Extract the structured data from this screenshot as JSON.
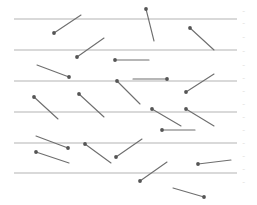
{
  "diagram": {
    "title": "",
    "type": "buffon-needle-simulation",
    "colors": {
      "background": "#ffffff",
      "line": "#b4b4b4",
      "needle": "#6e6e6e",
      "needle_head": "#555555",
      "label": "#c8c8c8"
    },
    "ruled_lines": [
      {
        "x1": 14,
        "x2": 237,
        "y": 19
      },
      {
        "x1": 14,
        "x2": 237,
        "y": 50
      },
      {
        "x1": 14,
        "x2": 237,
        "y": 81
      },
      {
        "x1": 14,
        "x2": 237,
        "y": 112
      },
      {
        "x1": 14,
        "x2": 237,
        "y": 143
      },
      {
        "x1": 14,
        "x2": 237,
        "y": 173
      }
    ],
    "needles": [
      {
        "hx": 54,
        "hy": 33,
        "tx": 81,
        "ty": 15
      },
      {
        "hx": 146,
        "hy": 9,
        "tx": 154,
        "ty": 41
      },
      {
        "hx": 77,
        "hy": 57,
        "tx": 104,
        "ty": 38
      },
      {
        "hx": 190,
        "hy": 28,
        "tx": 214,
        "ty": 50
      },
      {
        "hx": 115,
        "hy": 60,
        "tx": 149,
        "ty": 60
      },
      {
        "hx": 69,
        "hy": 77,
        "tx": 37,
        "ty": 65
      },
      {
        "hx": 167,
        "hy": 79,
        "tx": 133,
        "ty": 79
      },
      {
        "hx": 117,
        "hy": 81,
        "tx": 140,
        "ty": 104
      },
      {
        "hx": 186,
        "hy": 92,
        "tx": 214,
        "ty": 74
      },
      {
        "hx": 34,
        "hy": 97,
        "tx": 58,
        "ty": 119
      },
      {
        "hx": 79,
        "hy": 94,
        "tx": 104,
        "ty": 117
      },
      {
        "hx": 152,
        "hy": 109,
        "tx": 181,
        "ty": 126
      },
      {
        "hx": 186,
        "hy": 109,
        "tx": 214,
        "ty": 126
      },
      {
        "hx": 162,
        "hy": 130,
        "tx": 195,
        "ty": 130
      },
      {
        "hx": 68,
        "hy": 148,
        "tx": 36,
        "ty": 136
      },
      {
        "hx": 85,
        "hy": 144,
        "tx": 111,
        "ty": 163
      },
      {
        "hx": 36,
        "hy": 152,
        "tx": 69,
        "ty": 163
      },
      {
        "hx": 116,
        "hy": 157,
        "tx": 142,
        "ty": 139
      },
      {
        "hx": 198,
        "hy": 164,
        "tx": 231,
        "ty": 160
      },
      {
        "hx": 140,
        "hy": 181,
        "tx": 167,
        "ty": 162
      },
      {
        "hx": 204,
        "hy": 197,
        "tx": 173,
        "ty": 188
      }
    ],
    "side_labels": [
      {
        "y": 10,
        "text": "~"
      },
      {
        "y": 22,
        "text": "~"
      },
      {
        "y": 36,
        "text": "~"
      },
      {
        "y": 50,
        "text": "~"
      },
      {
        "y": 64,
        "text": "~"
      },
      {
        "y": 77,
        "text": "~"
      },
      {
        "y": 90,
        "text": "~"
      },
      {
        "y": 103,
        "text": "~"
      },
      {
        "y": 116,
        "text": "~"
      },
      {
        "y": 129,
        "text": "~"
      },
      {
        "y": 142,
        "text": "~"
      },
      {
        "y": 155,
        "text": "~"
      },
      {
        "y": 168,
        "text": "~"
      },
      {
        "y": 181,
        "text": "~"
      }
    ]
  }
}
